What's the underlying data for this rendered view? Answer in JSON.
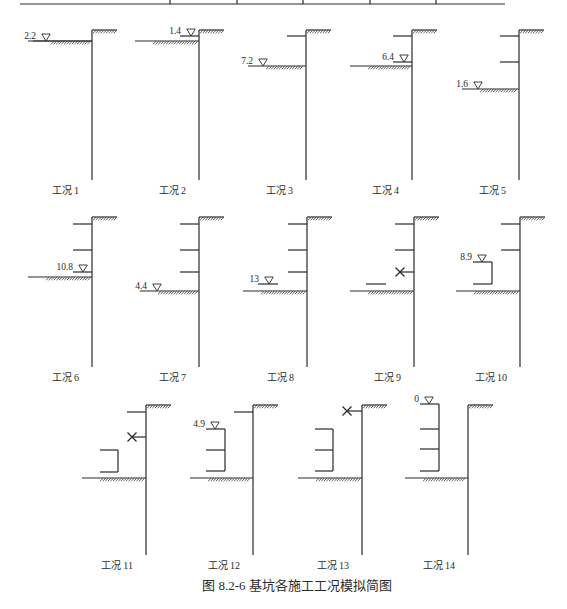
{
  "figure": {
    "caption": "图 8.2-6   基坑各施工工况模拟简图",
    "stroke_color": "#2a2a2a",
    "background": "#ffffff"
  },
  "header_rule": {
    "y": 4,
    "x1": 20,
    "x2": 505,
    "ticks_x": [
      170,
      237,
      303,
      370,
      436
    ]
  },
  "cases": [
    {
      "label": "工况 1",
      "wall_x": 92,
      "top_y": 30,
      "bottom_y": 180,
      "label_y": 194,
      "ground_y": 41,
      "ground_x1": 33,
      "struts": [],
      "water": {
        "text": "2.2",
        "x": 40,
        "y": 41,
        "line_to": 92
      }
    },
    {
      "label": "工况 2",
      "wall_x": 199,
      "top_y": 30,
      "bottom_y": 180,
      "label_y": 194,
      "ground_y": 41,
      "ground_x1": 135,
      "struts": [
        36
      ],
      "water": {
        "text": "1.4",
        "x": 185,
        "y": 36,
        "line_to": null
      }
    },
    {
      "label": "工况 3",
      "wall_x": 306,
      "top_y": 30,
      "bottom_y": 180,
      "label_y": 194,
      "ground_y": 66,
      "ground_x1": 248,
      "struts": [
        36
      ],
      "water": {
        "text": "7.2",
        "x": 257,
        "y": 66,
        "line_to": null
      }
    },
    {
      "label": "工况 4",
      "wall_x": 412,
      "top_y": 30,
      "bottom_y": 180,
      "label_y": 194,
      "ground_y": 66,
      "ground_x1": 350,
      "struts": [
        36,
        62
      ],
      "water": {
        "text": "6.4",
        "x": 398,
        "y": 62,
        "line_to": null
      }
    },
    {
      "label": "工况 5",
      "wall_x": 519,
      "top_y": 30,
      "bottom_y": 180,
      "label_y": 194,
      "ground_y": 89,
      "ground_x1": 462,
      "struts": [
        36,
        62
      ],
      "water": {
        "text": "1.6",
        "x": 472,
        "y": 89,
        "line_to": null
      }
    },
    {
      "label": "工况 6",
      "wall_x": 92,
      "top_y": 217,
      "bottom_y": 367,
      "label_y": 381,
      "ground_y": 277,
      "ground_x1": 28,
      "struts": [
        224,
        250,
        272
      ],
      "water": {
        "text": "10.8",
        "x": 77,
        "y": 272,
        "line_to": null
      }
    },
    {
      "label": "工况 7",
      "wall_x": 199,
      "top_y": 217,
      "bottom_y": 367,
      "label_y": 381,
      "ground_y": 291,
      "ground_x1": 140,
      "struts": [
        224,
        250,
        272
      ],
      "water": {
        "text": "4.4",
        "x": 151,
        "y": 291,
        "line_to": null
      }
    },
    {
      "label": "工况 8",
      "wall_x": 307,
      "top_y": 217,
      "bottom_y": 367,
      "label_y": 381,
      "ground_y": 291,
      "ground_x1": 243,
      "struts": [
        224,
        250,
        272
      ],
      "water": {
        "text": "13",
        "x": 263,
        "y": 284,
        "line_to": 278,
        "line_from": 258
      }
    },
    {
      "label": "工况 9",
      "wall_x": 414,
      "top_y": 217,
      "bottom_y": 367,
      "label_y": 381,
      "ground_y": 291,
      "ground_x1": 350,
      "struts": [
        224,
        250
      ],
      "removed_struts": [
        {
          "y": 272,
          "x": 400
        }
      ],
      "platform": {
        "y": 284,
        "x1": 366,
        "x2": 386
      },
      "water": null
    },
    {
      "label": "工况 10",
      "wall_x": 520,
      "top_y": 217,
      "bottom_y": 367,
      "label_y": 381,
      "ground_y": 291,
      "ground_x1": 456,
      "struts": [
        224,
        250
      ],
      "bracket": {
        "x1": 473,
        "x2": 492,
        "ys": [
          262,
          284
        ]
      },
      "water": {
        "text": "8.9",
        "x": 476,
        "y": 262,
        "line_to": null
      }
    },
    {
      "label": "工况 11",
      "wall_x": 146,
      "top_y": 405,
      "bottom_y": 555,
      "label_y": 569,
      "ground_y": 478,
      "ground_x1": 82,
      "struts": [
        412
      ],
      "removed_struts": [
        {
          "y": 437,
          "x": 132
        }
      ],
      "bracket": {
        "x1": 100,
        "x2": 118,
        "ys": [
          450,
          472
        ]
      },
      "water": null
    },
    {
      "label": "工况 12",
      "wall_x": 253,
      "top_y": 405,
      "bottom_y": 555,
      "label_y": 569,
      "ground_y": 478,
      "ground_x1": 190,
      "struts": [
        412
      ],
      "bracket": {
        "x1": 206,
        "x2": 225,
        "ys": [
          429,
          450,
          471
        ]
      },
      "water": {
        "text": "4.9",
        "x": 209,
        "y": 429,
        "line_to": null
      }
    },
    {
      "label": "工况 13",
      "wall_x": 362,
      "top_y": 405,
      "bottom_y": 555,
      "label_y": 569,
      "ground_y": 478,
      "ground_x1": 298,
      "struts": [],
      "removed_struts": [
        {
          "y": 411,
          "x": 347
        }
      ],
      "bracket": {
        "x1": 315,
        "x2": 333,
        "ys": [
          429,
          450,
          471
        ]
      },
      "water": null
    },
    {
      "label": "工况 14",
      "wall_x": 468,
      "top_y": 405,
      "bottom_y": 555,
      "label_y": 569,
      "ground_y": 478,
      "ground_x1": 405,
      "struts": [],
      "bracket": {
        "x1": 420,
        "x2": 439,
        "ys": [
          404,
          429,
          449,
          471
        ]
      },
      "water": {
        "text": "0",
        "x": 423,
        "y": 404,
        "line_to": null
      }
    }
  ]
}
